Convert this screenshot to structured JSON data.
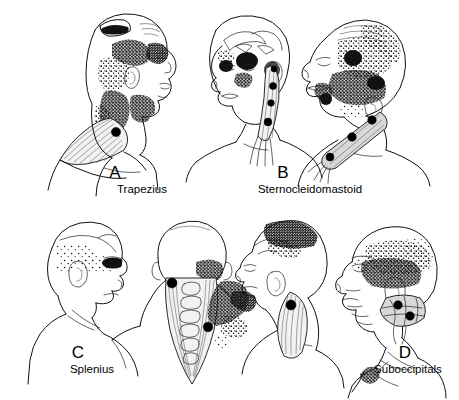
{
  "figure": {
    "background_color": "#ffffff",
    "ink_color": "#111111",
    "trigger_point_color": "#000000",
    "style": "black-and-white medical line drawing with stippled referred-pain zones",
    "width": 459,
    "height": 400
  },
  "panels": [
    {
      "letter": "A",
      "name": "Trapezius",
      "letter_x": 115,
      "letter_y": 178,
      "name_x": 112,
      "name_y": 193,
      "figure_count": 1,
      "view": "right-facing female head and neck profile",
      "trigger_points": 1,
      "pain_pattern": "stipple band from upper trapezius up posterolateral neck to mastoid, temple and angle of jaw"
    },
    {
      "letter": "B",
      "name": "Sternocleidomastoid",
      "letter_x": 283,
      "letter_y": 178,
      "name_x": 280,
      "name_y": 193,
      "figure_count": 2,
      "view": "left-facing female head with sternal division; head extended showing clavicular division",
      "trigger_points": 7,
      "pain_pattern": "dark patches over eye, cheek, ear and dense stipple over face, forehead and vertex"
    },
    {
      "letter": "C",
      "name": "Splenius",
      "letter_x": 78,
      "letter_y": 358,
      "name_x": 62,
      "name_y": 373,
      "figure_count": 3,
      "view": "right-facing man; posterior view of splenius capitis and cervicis; left-facing man",
      "trigger_points": 3,
      "pain_pattern": "stipple over scalp and vertex, dark patch at orbit, stipple to shoulder angle"
    },
    {
      "letter": "D",
      "name": "Suboccipitals",
      "letter_x": 405,
      "letter_y": 358,
      "name_x": 378,
      "name_y": 373,
      "figure_count": 1,
      "view": "left-facing bald man with suboccipital muscles exposed at skull base",
      "trigger_points": 2,
      "pain_pattern": "diffuse stipple band from occiput through temporal region to the eye"
    }
  ]
}
